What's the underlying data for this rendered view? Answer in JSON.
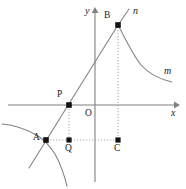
{
  "figure": {
    "axes": {
      "x_label": "x",
      "y_label": "y",
      "origin_label": "O",
      "x_axis_y": 105,
      "y_axis_x": 95,
      "x_axis_start": 8,
      "x_axis_end": 176,
      "y_axis_top": 9,
      "y_axis_bottom": 182,
      "color": "#808080"
    },
    "points": [
      {
        "id": "A",
        "label": "A",
        "x": 46,
        "y": 140,
        "label_dx": -11,
        "label_dy": -6
      },
      {
        "id": "P",
        "label": "P",
        "x": 69,
        "y": 105,
        "label_dx": -11,
        "label_dy": -14
      },
      {
        "id": "B",
        "label": "B",
        "x": 118,
        "y": 25,
        "label_dx": -13,
        "label_dy": -13
      },
      {
        "id": "Q",
        "label": "Q",
        "x": 69,
        "y": 140,
        "label_dx": -4,
        "label_dy": 4
      },
      {
        "id": "C",
        "label": "C",
        "x": 118,
        "y": 140,
        "label_dx": -4,
        "label_dy": 4
      }
    ],
    "curve_labels": [
      {
        "id": "n",
        "label": "n",
        "x": 134,
        "y": 8
      },
      {
        "id": "m",
        "label": "m",
        "x": 163,
        "y": 66
      }
    ],
    "marker_color": "#121212",
    "curve_color": "#808080",
    "guide_color": "#9a9a9a",
    "background": "#ffffff"
  }
}
